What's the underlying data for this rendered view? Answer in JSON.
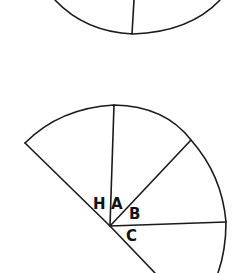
{
  "figure": {
    "type": "sector diagram",
    "labels": {
      "H": "H",
      "A": "A",
      "B": "B",
      "C": "C"
    },
    "colors": {
      "line": "#1a1a1a",
      "background": "#ffffff"
    }
  }
}
